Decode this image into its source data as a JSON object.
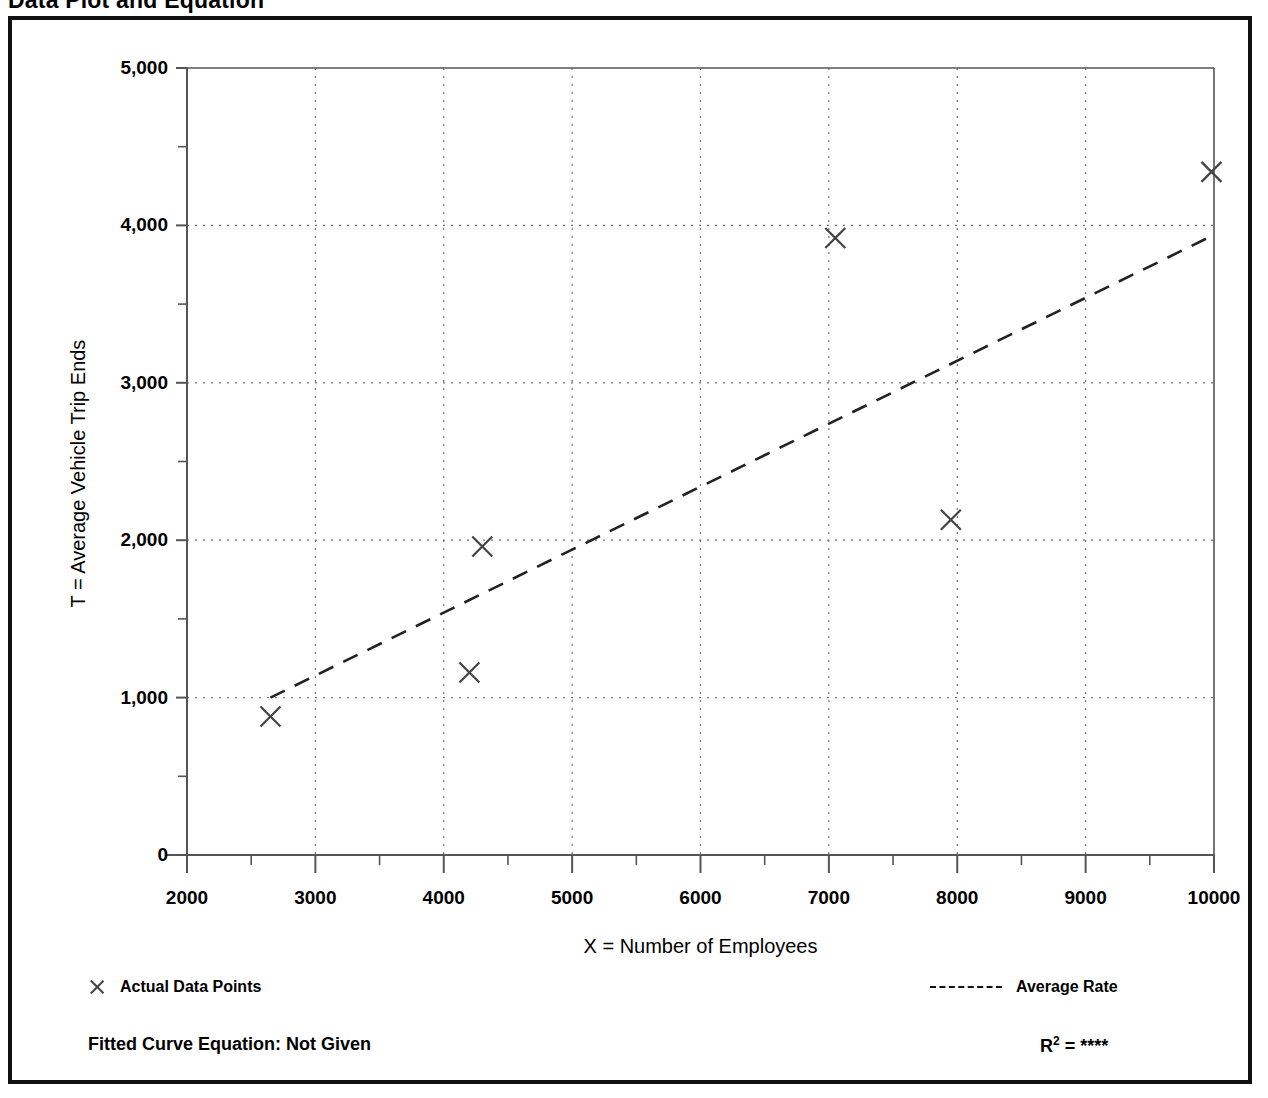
{
  "page": {
    "title": "Data Plot and Equation"
  },
  "legend": {
    "points_label": "Actual Data Points",
    "line_label": "Average Rate",
    "point_marker_icon": "x-marker-icon",
    "line_marker_icon": "dashed-line-icon"
  },
  "footer": {
    "fitted_equation": "Fitted Curve Equation:  Not Given",
    "r_squared_prefix": "R",
    "r_squared_exponent": "2",
    "r_squared_value": " =  ****"
  },
  "style": {
    "frame_color": "#111111",
    "axis_color": "#555555",
    "grid_color": "#777777",
    "marker_color": "#444444",
    "trend_color": "#222222",
    "background": "#ffffff"
  },
  "chart_data": {
    "type": "scatter",
    "title": "Data Plot and Equation",
    "xlabel": "X = Number of Employees",
    "ylabel": "T = Average Vehicle Trip Ends",
    "xlim": [
      2000,
      10000
    ],
    "ylim": [
      0,
      5000
    ],
    "xticks": [
      2000,
      3000,
      4000,
      5000,
      6000,
      7000,
      8000,
      9000,
      10000
    ],
    "xtick_labels": [
      "2000",
      "3000",
      "4000",
      "5000",
      "6000",
      "7000",
      "8000",
      "9000",
      "10000"
    ],
    "yticks": [
      0,
      1000,
      2000,
      3000,
      4000,
      5000
    ],
    "ytick_labels": [
      "0",
      "1,000",
      "2,000",
      "3,000",
      "4,000",
      "5,000"
    ],
    "y_minor_ticks": [
      500,
      1500,
      2500,
      3500,
      4500
    ],
    "grid": true,
    "grid_style": "dotted",
    "legend_position": "below-axes",
    "series": [
      {
        "name": "Actual Data Points",
        "type": "scatter",
        "marker": "x",
        "points": [
          {
            "x": 2650,
            "y": 880
          },
          {
            "x": 4200,
            "y": 1160
          },
          {
            "x": 4300,
            "y": 1960
          },
          {
            "x": 7050,
            "y": 3920
          },
          {
            "x": 7950,
            "y": 2130
          },
          {
            "x": 9980,
            "y": 4340
          }
        ]
      },
      {
        "name": "Average Rate",
        "type": "line",
        "linestyle": "dashed",
        "points": [
          {
            "x": 2650,
            "y": 1000
          },
          {
            "x": 10000,
            "y": 3940
          }
        ]
      }
    ],
    "annotations": [
      "Fitted Curve Equation:  Not Given",
      "R2 =  ****"
    ]
  }
}
